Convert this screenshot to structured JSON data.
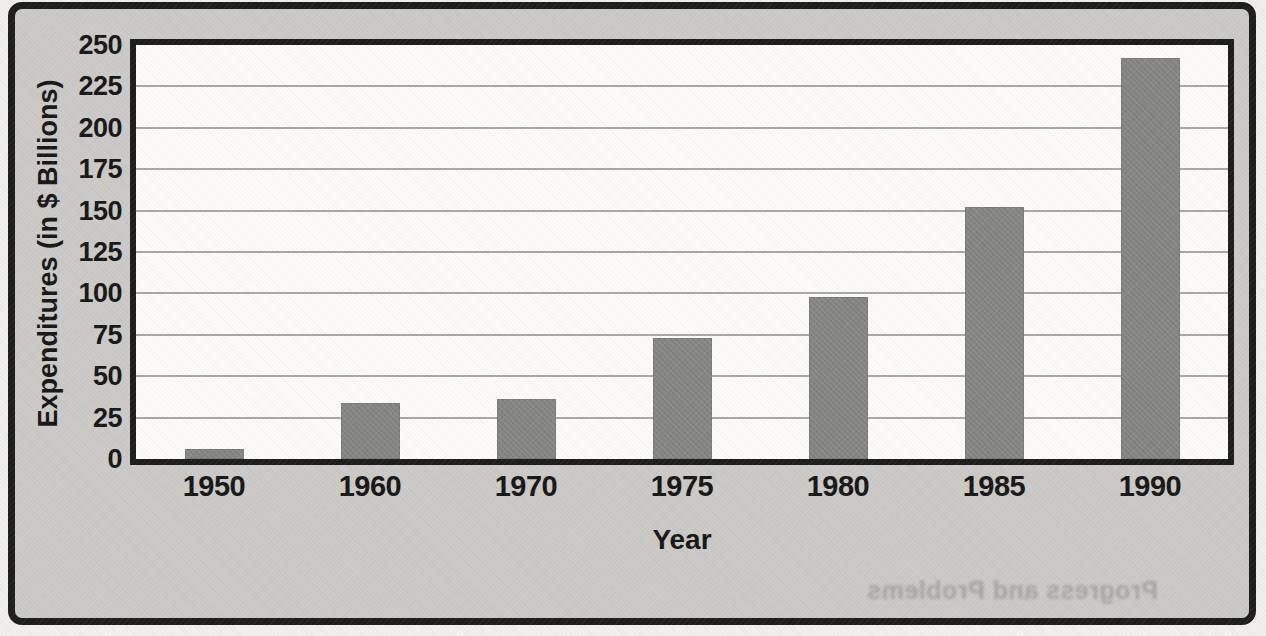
{
  "figure": {
    "y_axis_title": "Expenditures (in $ Billions)",
    "x_axis_title": "Year",
    "bleed_through_text": "Progress and Problems"
  },
  "chart_data": {
    "type": "bar",
    "title": "",
    "categories": [
      "1950",
      "1960",
      "1970",
      "1975",
      "1980",
      "1985",
      "1990"
    ],
    "values": [
      6,
      34,
      36,
      73,
      98,
      152,
      242
    ],
    "xlabel": "Year",
    "ylabel": "Expenditures (in $ Billions)",
    "ylim": [
      0,
      250
    ],
    "ytick_interval": 25,
    "yticks": [
      0,
      25,
      50,
      75,
      100,
      125,
      150,
      175,
      200,
      225,
      250
    ],
    "grid": "horizontal",
    "legend": "none",
    "colors": {
      "bar": "#8a8a89",
      "plot_background": "#fcfbf8",
      "frame_background": "#cbcac7",
      "page_background": "#f2f0ed",
      "border": "#1d1d1b",
      "gridline": "#a9a8a5",
      "text": "#171715"
    }
  }
}
